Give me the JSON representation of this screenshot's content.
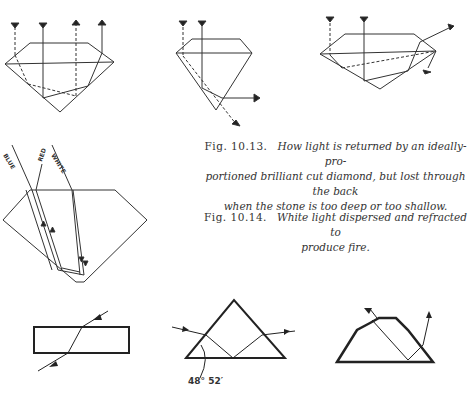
{
  "captions": {
    "fig_10_13": {
      "number": "Fig. 10.13.",
      "text_line1": "How light is returned by an ideally-pro-",
      "text_line2": "portioned brilliant cut diamond, but lost through the back",
      "text_line3": "when the stone is too deep or too shallow."
    },
    "fig_10_14": {
      "number": "Fig. 10.14.",
      "text_line1": "White light dispersed and refracted to",
      "text_line2": "produce fire."
    }
  },
  "ray_labels": {
    "blue": "BLUE",
    "red": "RED",
    "white": "WHITE"
  },
  "angle_label": "48° 52′",
  "diagrams": [
    "ideal-cut-diamond",
    "too-deep-diamond",
    "too-shallow-diamond",
    "dispersion-diamond",
    "glass-slab-refraction",
    "prism-critical-angle",
    "brilliant-profile-internal-reflection"
  ]
}
